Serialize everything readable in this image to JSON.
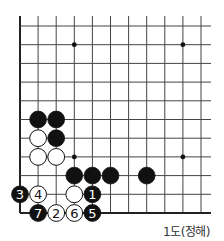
{
  "diagram": {
    "caption": "1도(정해)",
    "board": {
      "origin_x": 20,
      "origin_y": 26,
      "col_spacing": 18.1,
      "row_spacing": 18.7,
      "cols": 11,
      "rows": 11,
      "top_extend_y": 16,
      "right_extend_x": 211,
      "edges": [
        "left",
        "bottom"
      ],
      "line_color": "#444444",
      "edge_color": "#222222"
    },
    "star_points": [
      [
        3,
        1
      ],
      [
        9,
        1
      ],
      [
        3,
        7
      ],
      [
        9,
        7
      ]
    ],
    "stones": [
      {
        "color": "black",
        "col": 1,
        "row": 5
      },
      {
        "color": "black",
        "col": 2,
        "row": 5
      },
      {
        "color": "black",
        "col": 2,
        "row": 6
      },
      {
        "color": "black",
        "col": 3,
        "row": 8
      },
      {
        "color": "black",
        "col": 4,
        "row": 8
      },
      {
        "color": "black",
        "col": 5,
        "row": 8
      },
      {
        "color": "black",
        "col": 7,
        "row": 8
      },
      {
        "color": "white",
        "col": 1,
        "row": 6
      },
      {
        "color": "white",
        "col": 1,
        "row": 7
      },
      {
        "color": "white",
        "col": 2,
        "row": 7
      },
      {
        "color": "white",
        "col": 3,
        "row": 9
      },
      {
        "color": "black",
        "col": 4,
        "row": 9,
        "label": "1"
      },
      {
        "color": "white",
        "col": 2,
        "row": 10,
        "label": "2"
      },
      {
        "color": "black",
        "col": 0,
        "row": 9,
        "label": "3"
      },
      {
        "color": "white",
        "col": 1,
        "row": 9,
        "label": "4"
      },
      {
        "color": "black",
        "col": 4,
        "row": 10,
        "label": "5"
      },
      {
        "color": "white",
        "col": 3,
        "row": 10,
        "label": "6"
      },
      {
        "color": "black",
        "col": 1,
        "row": 10,
        "label": "7"
      }
    ]
  }
}
